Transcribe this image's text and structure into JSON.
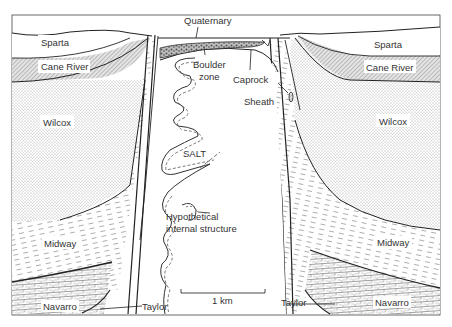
{
  "diagram": {
    "type": "geological-cross-section",
    "colors": {
      "line": "#222222",
      "text": "#333333",
      "background": "#ffffff",
      "stipple": "#8a8a8a",
      "hatch": "#777777"
    },
    "labels": {
      "quaternary": "Quaternary",
      "sparta_left": "Sparta",
      "sparta_right": "Sparta",
      "cane_river_left": "Cane River",
      "cane_river_right": "Cane River",
      "wilcox_left": "Wilcox",
      "wilcox_right": "Wilcox",
      "midway_left": "Midway",
      "midway_right": "Midway",
      "navarro_left": "Navarro",
      "navarro_right": "Navarro",
      "taylor_left": "Taylor",
      "taylor_right": "Taylor",
      "boulder_zone_line1": "Boulder",
      "boulder_zone_line2": "zone",
      "caprock": "Caprock",
      "sheath": "Sheath",
      "salt": "SALT",
      "hypothetical_line1": "Hypothetical",
      "hypothetical_line2": "internal structure",
      "scale_bar": "1 km"
    },
    "layers_top_to_bottom": [
      "Quaternary",
      "Sparta",
      "Cane River",
      "Wilcox",
      "Midway",
      "Navarro",
      "Taylor"
    ],
    "features": [
      "Caprock",
      "Boulder zone",
      "Sheath",
      "SALT",
      "Hypothetical internal structure"
    ]
  }
}
